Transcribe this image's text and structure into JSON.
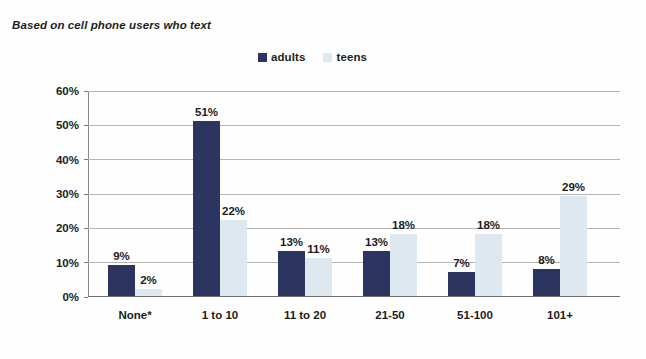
{
  "caption": "Based on cell phone users who text",
  "legend": {
    "position": "top-center",
    "entries": [
      {
        "label": "adults",
        "color": "#2c3560",
        "swatch_icon": "square-swatch-icon"
      },
      {
        "label": "teens",
        "color": "#dde8f1",
        "swatch_icon": "square-swatch-icon"
      }
    ]
  },
  "chart_data": {
    "type": "bar",
    "title": "Based on cell phone users who text",
    "xlabel": "",
    "ylabel": "",
    "ylim": [
      0,
      60
    ],
    "grid": true,
    "legend_position": "top-center",
    "categories": [
      "None*",
      "1 to 10",
      "11 to 20",
      "21-50",
      "51-100",
      "101+"
    ],
    "yticks": [
      0,
      10,
      20,
      30,
      40,
      50,
      60
    ],
    "ytick_labels": [
      "0%",
      "10%",
      "20%",
      "30%",
      "40%",
      "50%",
      "60%"
    ],
    "series": [
      {
        "name": "adults",
        "color": "#2c3560",
        "values": [
          9,
          51,
          13,
          13,
          7,
          8
        ],
        "data_labels": [
          "9%",
          "51%",
          "13%",
          "13%",
          "7%",
          "8%"
        ]
      },
      {
        "name": "teens",
        "color": "#dde8f1",
        "values": [
          2,
          22,
          11,
          18,
          18,
          29
        ],
        "data_labels": [
          "2%",
          "22%",
          "11%",
          "18%",
          "18%",
          "29%"
        ]
      }
    ]
  }
}
